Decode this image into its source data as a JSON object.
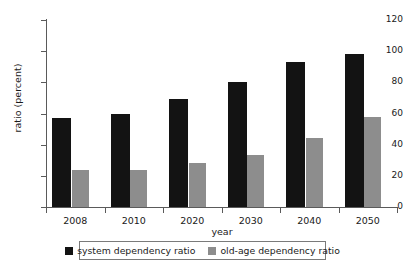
{
  "top_clipped_caption": "",
  "chart_data": {
    "type": "bar",
    "title": "",
    "xlabel": "year",
    "ylabel": "ratio (percent)",
    "categories": [
      "2008",
      "2010",
      "2020",
      "2030",
      "2040",
      "2050"
    ],
    "series": [
      {
        "name": "system dependency ratio",
        "color": "#131313",
        "values": [
          57,
          60,
          69,
          80,
          93,
          98
        ]
      },
      {
        "name": "old-age dependency ratio",
        "color": "#8d8d8d",
        "values": [
          23.5,
          24,
          28.5,
          33.5,
          44.5,
          57.5
        ]
      }
    ],
    "ylim": [
      0,
      120
    ],
    "yticks": [
      0,
      20,
      40,
      60,
      80,
      100,
      120
    ],
    "ytick_labels": [
      "0",
      "20",
      "40",
      "60",
      "80",
      "100",
      "120"
    ],
    "grid": false,
    "legend_position": "bottom"
  }
}
